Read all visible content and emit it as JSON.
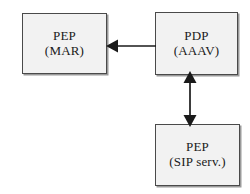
{
  "diagram": {
    "title": "",
    "background_color": "#ffffff",
    "node_fill_color": "#f2f2f2",
    "node_border_color": "#4a4a4a",
    "edge_color": "#1a1a1a",
    "nodes": [
      {
        "id": "pep-mar",
        "line1": "PEP",
        "line2": "(MAR)"
      },
      {
        "id": "pdp-aaav",
        "line1": "PDP",
        "line2": "(AAAV)"
      },
      {
        "id": "pep-sip",
        "line1": "PEP",
        "line2": "(SIP serv.)"
      }
    ],
    "edges": [
      {
        "id": "pdp-to-mar",
        "from": "pdp-aaav",
        "to": "pep-mar",
        "direction": "unidirectional",
        "orientation": "horizontal",
        "arrowheads": "end"
      },
      {
        "id": "pdp-sip",
        "from": "pdp-aaav",
        "to": "pep-sip",
        "direction": "bidirectional",
        "orientation": "vertical",
        "arrowheads": "both"
      }
    ]
  }
}
